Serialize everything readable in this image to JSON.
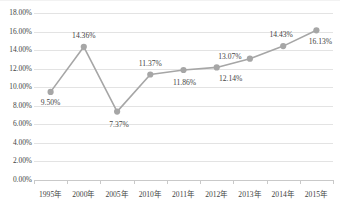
{
  "chart_data": {
    "type": "line",
    "title": "",
    "subtitle": "",
    "xlabel": "",
    "ylabel": "",
    "categories": [
      "1995年",
      "2000年",
      "2005年",
      "2010年",
      "2011年",
      "2012年",
      "2013年",
      "2014年",
      "2015年"
    ],
    "values": [
      9.5,
      14.36,
      7.37,
      11.37,
      11.86,
      12.14,
      13.07,
      14.43,
      16.13
    ],
    "data_labels": [
      "9.50%",
      "14.36%",
      "7.37%",
      "11.37%",
      "11.86%",
      "12.14%",
      "13.07%",
      "14.43%",
      "16.13%"
    ],
    "ylim": [
      0,
      18
    ],
    "ytick_labels": [
      "18.00%",
      "16.00%",
      "14.00%",
      "12.00%",
      "10.00%",
      "8.00%",
      "6.00%",
      "4.00%",
      "2.00%",
      "0.00%"
    ],
    "ytick_values": [
      18,
      16,
      14,
      12,
      10,
      8,
      6,
      4,
      2,
      0
    ],
    "grid": true,
    "legend": "none",
    "series": [
      {
        "name": "",
        "values": [
          9.5,
          14.36,
          7.37,
          11.37,
          11.86,
          12.14,
          13.07,
          14.43,
          16.13
        ],
        "line_color": "#a6a6a6",
        "marker_color": "#a6a6a6",
        "marker": "circle"
      }
    ],
    "colors": {
      "line": "#a6a6a6",
      "marker": "#a6a6a6",
      "grid": "#e3e3e3",
      "axis": "#c9c9c9",
      "text": "#3f3f3f",
      "background": "#ffffff"
    }
  },
  "label_offsets": [
    {
      "dx": 0,
      "dy": 11
    },
    {
      "dx": 0,
      "dy": -11
    },
    {
      "dx": 2,
      "dy": 13
    },
    {
      "dx": 0,
      "dy": -11
    },
    {
      "dx": 1,
      "dy": 13
    },
    {
      "dx": 14,
      "dy": 12
    },
    {
      "dx": -20,
      "dy": -2
    },
    {
      "dx": -2,
      "dy": -11
    },
    {
      "dx": 4,
      "dy": 12
    }
  ]
}
